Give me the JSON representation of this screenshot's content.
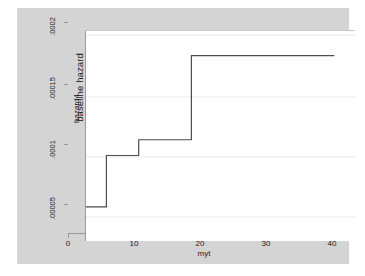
{
  "chart_data": {
    "type": "line",
    "subtype": "step",
    "title": "",
    "xlabel": "myt",
    "ylabel": "hazard4",
    "ylabel_outer": "baseline hazard",
    "xlim": [
      0,
      41
    ],
    "ylim": [
      0,
      0.000213
    ],
    "xticks": [
      0,
      10,
      20,
      30,
      40
    ],
    "xticklabels": [
      "0",
      "10",
      "20",
      "30",
      "40"
    ],
    "yticks": [
      5e-05,
      0.0001,
      0.00015,
      0.0002
    ],
    "yticklabels": [
      ".00005",
      ".0001",
      ".00015",
      ".0002"
    ],
    "grid": "y-only",
    "legend": "none",
    "series": [
      {
        "name": "hazard4",
        "color": "#4d4d4d",
        "x": [
          0,
          3.1,
          3.1,
          8.0,
          8.0,
          16.0,
          16.0,
          37.7
        ],
        "y": [
          3.55e-05,
          3.55e-05,
          8.73e-05,
          8.73e-05,
          0.0001032,
          0.0001032,
          0.0001882,
          0.0001882
        ],
        "steps": [
          {
            "x_start": 0,
            "x_end": 3.1,
            "value": 3.55e-05
          },
          {
            "x_start": 3.1,
            "x_end": 8.0,
            "value": 8.73e-05
          },
          {
            "x_start": 8.0,
            "x_end": 16.0,
            "value": 0.0001032
          },
          {
            "x_start": 16.0,
            "x_end": 37.7,
            "value": 0.0001882
          }
        ]
      }
    ]
  },
  "axes": {
    "x_title": "myt",
    "y_title_inner": "hazard4",
    "y_title_outer": "baseline hazard",
    "x_tick_0": "0",
    "x_tick_1": "10",
    "x_tick_2": "20",
    "x_tick_3": "30",
    "x_tick_4": "40",
    "y_tick_0": ".00005",
    "y_tick_1": ".0001",
    "y_tick_2": ".00015",
    "y_tick_3": ".0002"
  },
  "colors": {
    "graph_region": "#d4d4d4",
    "plot_background": "#ffffff",
    "line": "#4d4d4d",
    "gridline": "#e8e8e8",
    "axis": "#9a9a9a",
    "text": "#1a1a1a"
  }
}
